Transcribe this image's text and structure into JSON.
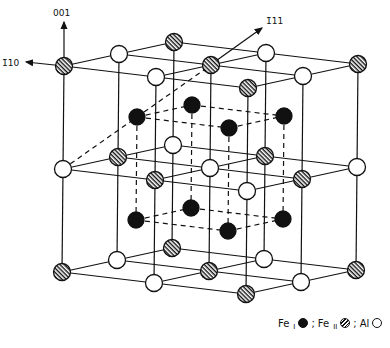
{
  "diagram": {
    "type": "crystal-structure",
    "axes": [
      {
        "name": "axis-001",
        "label": "001"
      },
      {
        "name": "axis-1-10",
        "label": "1̄10"
      },
      {
        "name": "axis-111",
        "label": "1̄11"
      }
    ],
    "lattice": {
      "origin": [
        64,
        66
      ],
      "a": [
        92,
        11
      ],
      "b": [
        55,
        -12
      ],
      "c": [
        -1,
        103
      ],
      "nodes_type_by_layer": [
        [
          [
            "H",
            "O",
            "H"
          ],
          [
            "O",
            "H",
            "O"
          ],
          [
            "H",
            "O",
            "H"
          ]
        ],
        [
          [
            "O",
            "H",
            "O"
          ],
          [
            "H",
            "O",
            "H"
          ],
          [
            "O",
            "H",
            "O"
          ]
        ],
        [
          [
            "H",
            "O",
            "H"
          ],
          [
            "O",
            "H",
            "O"
          ],
          [
            "H",
            "O",
            "H"
          ]
        ]
      ]
    },
    "legend": {
      "fe1": {
        "text": "Fe",
        "sub": "I",
        "sep": ";"
      },
      "fe2": {
        "text": "Fe",
        "sub": "II",
        "sep": ";"
      },
      "al": {
        "text": "Al"
      }
    }
  }
}
